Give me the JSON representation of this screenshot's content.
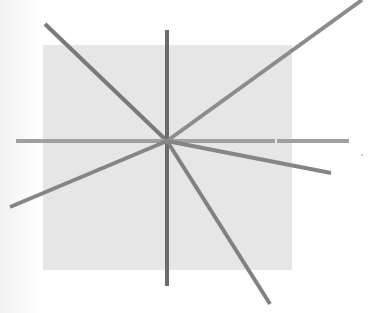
{
  "diagram": {
    "center": {
      "x": 167,
      "y": 141
    },
    "square": {
      "x": 43,
      "y": 45,
      "width": 249,
      "height": 225,
      "color": "#e6e6e6"
    },
    "colors": {
      "background": "#ffffff",
      "square": "#e6e6e6",
      "line_dark": "#6f6f6f",
      "line_mid": "#8a8a8a",
      "line_light": "#9d9d9d"
    },
    "lines": [
      {
        "name": "line-upper-left",
        "x1": 45,
        "y1": 24,
        "x2": 167,
        "y2": 141,
        "color": "#7a7a7a",
        "width": 4
      },
      {
        "name": "line-vertical",
        "x1": 167,
        "y1": 30,
        "x2": 167,
        "y2": 286,
        "color": "#6b6b6b",
        "width": 4
      },
      {
        "name": "line-upper-right",
        "x1": 362,
        "y1": 0,
        "x2": 167,
        "y2": 141,
        "color": "#8c8c8c",
        "width": 4
      },
      {
        "name": "line-horizontal",
        "x1": 16,
        "y1": 141,
        "x2": 349,
        "y2": 141,
        "color": "#9f9f9f",
        "width": 4
      },
      {
        "name": "line-lower-left",
        "x1": 10,
        "y1": 207,
        "x2": 167,
        "y2": 141,
        "color": "#858585",
        "width": 4
      },
      {
        "name": "line-lower-right",
        "x1": 167,
        "y1": 141,
        "x2": 270,
        "y2": 304,
        "color": "#818181",
        "width": 4
      },
      {
        "name": "line-right-shallow",
        "x1": 167,
        "y1": 141,
        "x2": 331,
        "y2": 173,
        "color": "#858585",
        "width": 4
      }
    ]
  }
}
